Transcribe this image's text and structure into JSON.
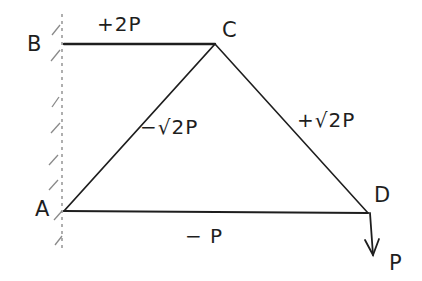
{
  "diagram": {
    "type": "truss",
    "style": "hand-drawn sketch",
    "stroke_color": "#1e1e1e",
    "background": "#ffffff",
    "support": {
      "type": "fixed wall",
      "nodes": [
        "A",
        "B"
      ]
    },
    "nodes": {
      "A": {
        "label": "A",
        "x": 64,
        "y": 211
      },
      "B": {
        "label": "B",
        "x": 64,
        "y": 44
      },
      "C": {
        "label": "C",
        "x": 215,
        "y": 44
      },
      "D": {
        "label": "D",
        "x": 368,
        "y": 213
      }
    },
    "members": [
      {
        "id": "BC",
        "from": "B",
        "to": "C",
        "force": "+2P"
      },
      {
        "id": "AC",
        "from": "A",
        "to": "C",
        "force": "−√2P"
      },
      {
        "id": "CD",
        "from": "C",
        "to": "D",
        "force": "+√2P"
      },
      {
        "id": "AD",
        "from": "A",
        "to": "D",
        "force": "− P"
      }
    ],
    "load": {
      "node": "D",
      "direction": "down",
      "label": "P"
    }
  }
}
